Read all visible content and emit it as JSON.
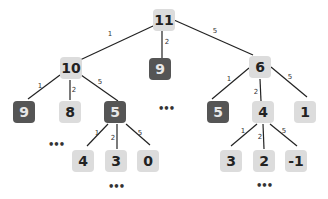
{
  "nodes": [
    {
      "id": "n11",
      "label": "11",
      "x": 164,
      "y": 20,
      "style": "light"
    },
    {
      "id": "n10",
      "label": "10",
      "x": 71,
      "y": 68,
      "style": "light"
    },
    {
      "id": "n9m",
      "label": "9",
      "x": 160,
      "y": 69,
      "style": "dark"
    },
    {
      "id": "n6",
      "label": "6",
      "x": 260,
      "y": 67,
      "style": "light"
    },
    {
      "id": "n9l",
      "label": "9",
      "x": 24,
      "y": 112,
      "style": "dark"
    },
    {
      "id": "n8",
      "label": "8",
      "x": 70,
      "y": 112,
      "style": "light"
    },
    {
      "id": "n5l",
      "label": "5",
      "x": 115,
      "y": 112,
      "style": "dark"
    },
    {
      "id": "n5r",
      "label": "5",
      "x": 218,
      "y": 112,
      "style": "dark"
    },
    {
      "id": "n4r",
      "label": "4",
      "x": 263,
      "y": 112,
      "style": "light"
    },
    {
      "id": "n1",
      "label": "1",
      "x": 305,
      "y": 112,
      "style": "light"
    },
    {
      "id": "n4",
      "label": "4",
      "x": 83,
      "y": 161,
      "style": "light"
    },
    {
      "id": "n3l",
      "label": "3",
      "x": 116,
      "y": 161,
      "style": "light"
    },
    {
      "id": "n0",
      "label": "0",
      "x": 148,
      "y": 161,
      "style": "light"
    },
    {
      "id": "n3r",
      "label": "3",
      "x": 231,
      "y": 161,
      "style": "light"
    },
    {
      "id": "n2",
      "label": "2",
      "x": 264,
      "y": 161,
      "style": "light"
    },
    {
      "id": "nm1",
      "label": "-1",
      "x": 296,
      "y": 161,
      "style": "light"
    }
  ],
  "edges": [
    {
      "from": "n11",
      "to": "n10",
      "weight": "1",
      "x1": 153,
      "y1": 26,
      "x2": 80,
      "y2": 60,
      "lx": 110,
      "ly": 34
    },
    {
      "from": "n11",
      "to": "n9m",
      "weight": "2",
      "x1": 162,
      "y1": 31,
      "x2": 162,
      "y2": 58,
      "lx": 167,
      "ly": 42
    },
    {
      "from": "n11",
      "to": "n6",
      "weight": "5",
      "x1": 174,
      "y1": 20,
      "x2": 253,
      "y2": 55,
      "lx": 215,
      "ly": 31
    },
    {
      "from": "n10",
      "to": "n9l",
      "weight": "1",
      "x1": 60,
      "y1": 75,
      "x2": 28,
      "y2": 99,
      "lx": 40,
      "ly": 86
    },
    {
      "from": "n10",
      "to": "n8",
      "weight": "2",
      "x1": 70,
      "y1": 80,
      "x2": 70,
      "y2": 100,
      "lx": 74,
      "ly": 90
    },
    {
      "from": "n10",
      "to": "n5l",
      "weight": "5",
      "x1": 81,
      "y1": 75,
      "x2": 118,
      "y2": 101,
      "lx": 100,
      "ly": 82
    },
    {
      "from": "n6",
      "to": "n5r",
      "weight": "1",
      "x1": 249,
      "y1": 68,
      "x2": 212,
      "y2": 99,
      "lx": 229,
      "ly": 79
    },
    {
      "from": "n6",
      "to": "n4r",
      "weight": "2",
      "x1": 260,
      "y1": 79,
      "x2": 261,
      "y2": 101,
      "lx": 256,
      "ly": 92
    },
    {
      "from": "n6",
      "to": "n1",
      "weight": "5",
      "x1": 271,
      "y1": 67,
      "x2": 307,
      "y2": 97,
      "lx": 290,
      "ly": 77
    },
    {
      "from": "n5l",
      "to": "n4",
      "weight": "1",
      "x1": 108,
      "y1": 124,
      "x2": 87,
      "y2": 146,
      "lx": 97,
      "ly": 133
    },
    {
      "from": "n5l",
      "to": "n3l",
      "weight": "2",
      "x1": 117,
      "y1": 124,
      "x2": 117,
      "y2": 149,
      "lx": 113,
      "ly": 138
    },
    {
      "from": "n5l",
      "to": "n0",
      "weight": "5",
      "x1": 126,
      "y1": 124,
      "x2": 150,
      "y2": 145,
      "lx": 140,
      "ly": 133
    },
    {
      "from": "n4r",
      "to": "n3r",
      "weight": "1",
      "x1": 257,
      "y1": 124,
      "x2": 231,
      "y2": 146,
      "lx": 243,
      "ly": 131
    },
    {
      "from": "n4r",
      "to": "n2",
      "weight": "2",
      "x1": 263,
      "y1": 124,
      "x2": 264,
      "y2": 149,
      "lx": 260,
      "ly": 137
    },
    {
      "from": "n4r",
      "to": "nm1",
      "weight": "5",
      "x1": 270,
      "y1": 124,
      "x2": 297,
      "y2": 146,
      "lx": 284,
      "ly": 131
    }
  ],
  "ellipses": [
    {
      "label": "•••",
      "x": 56,
      "y": 144
    },
    {
      "label": "•••",
      "x": 166,
      "y": 108
    },
    {
      "label": "•••",
      "x": 116,
      "y": 186
    },
    {
      "label": "•••",
      "x": 264,
      "y": 185
    }
  ],
  "colors": {
    "light_node": "#dcdcdc",
    "dark_node": "#555555",
    "edge": "#222222"
  }
}
